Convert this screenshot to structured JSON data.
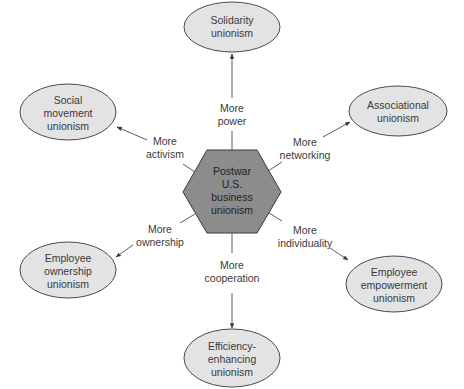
{
  "diagram": {
    "center": {
      "lines": [
        "Postwar",
        "U.S.",
        "business",
        "unionism"
      ],
      "fill": "#8c8c8c"
    },
    "nodes": [
      {
        "id": "solidarity",
        "lines": [
          "Solidarity",
          "unionism"
        ],
        "cx": 232,
        "cy": 27,
        "rx": 48,
        "ry": 25
      },
      {
        "id": "social-movement",
        "lines": [
          "Social",
          "movement",
          "unionism"
        ],
        "cx": 68,
        "cy": 112,
        "rx": 48,
        "ry": 28
      },
      {
        "id": "associational",
        "lines": [
          "Associational",
          "unionism"
        ],
        "cx": 398,
        "cy": 111,
        "rx": 49,
        "ry": 25
      },
      {
        "id": "employee-ownership",
        "lines": [
          "Employee",
          "ownership",
          "unionism"
        ],
        "cx": 68,
        "cy": 270,
        "rx": 48,
        "ry": 28
      },
      {
        "id": "employee-empowerment",
        "lines": [
          "Employee",
          "empowerment",
          "unionism"
        ],
        "cx": 394,
        "cy": 284,
        "rx": 48,
        "ry": 28
      },
      {
        "id": "efficiency-enhancing",
        "lines": [
          "Efficiency-",
          "enhancing",
          "unionism"
        ],
        "cx": 232,
        "cy": 358,
        "rx": 48,
        "ry": 29
      }
    ],
    "edges": [
      {
        "to": "solidarity",
        "label": [
          "More",
          "power"
        ]
      },
      {
        "to": "social-movement",
        "label": [
          "More",
          "activism"
        ]
      },
      {
        "to": "associational",
        "label": [
          "More",
          "networking"
        ]
      },
      {
        "to": "employee-ownership",
        "label": [
          "More",
          "ownership"
        ]
      },
      {
        "to": "employee-empowerment",
        "label": [
          "More",
          "individuality"
        ]
      },
      {
        "to": "efficiency-enhancing",
        "label": [
          "More",
          "cooperation"
        ]
      }
    ],
    "colors": {
      "ellipse_fill": "#e3e3e3",
      "hex_fill": "#8c8c8c",
      "stroke": "#4a4a4a"
    }
  }
}
